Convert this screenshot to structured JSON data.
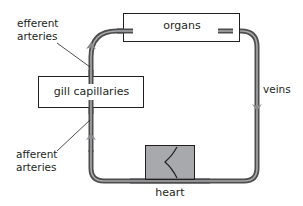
{
  "diagram": {
    "nodes": [
      {
        "id": "organs",
        "label": "organs"
      },
      {
        "id": "gill_capillaries",
        "label": "gill capillaries"
      },
      {
        "id": "heart",
        "label": "heart"
      }
    ],
    "labels": {
      "efferent_line1": "efferent",
      "efferent_line2": "arteries",
      "afferent_line1": "afferent",
      "afferent_line2": "arteries",
      "veins": "veins",
      "heart": "heart"
    },
    "flow": [
      {
        "from": "heart",
        "to": "gill_capillaries",
        "via": "afferent arteries",
        "direction": "up"
      },
      {
        "from": "gill_capillaries",
        "to": "organs",
        "via": "efferent arteries",
        "direction": "up"
      },
      {
        "from": "organs",
        "to": "heart",
        "via": "veins",
        "direction": "down"
      }
    ],
    "colors": {
      "vessel_outer": "#4d4d4d",
      "vessel_inner": "#a7a9ac",
      "arrow": "#8a8c8e",
      "heart_fill": "#a7a9ac",
      "box_stroke": "#231f20",
      "text": "#231f20"
    }
  }
}
